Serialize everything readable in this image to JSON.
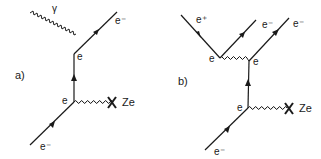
{
  "diagrams": {
    "a": {
      "panel_label": "a)",
      "photon_label": "γ",
      "vertex_top_label": "e",
      "vertex_bottom_label": "e",
      "outgoing_electron_label": "e⁻",
      "incoming_electron_label": "e⁻",
      "nucleus_label": "Ze"
    },
    "b": {
      "panel_label": "b)",
      "positron_label": "e⁺",
      "vertex_left_label": "e",
      "vertex_right_label": "e",
      "vertex_bottom_label": "e",
      "outgoing_electron_1_label": "e⁻",
      "outgoing_electron_2_label": "e⁻",
      "incoming_electron_label": "e⁻",
      "nucleus_label": "Ze"
    }
  },
  "colors": {
    "ink": "#1a1a1a",
    "background": "#ffffff"
  }
}
